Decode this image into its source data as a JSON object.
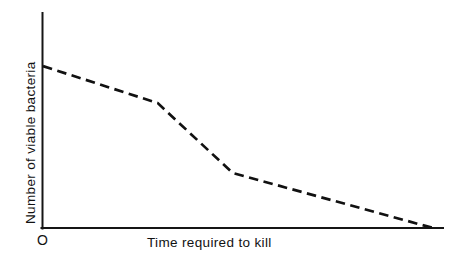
{
  "figure": {
    "background_color": "#ffffff",
    "ink_color": "#111111",
    "origin_label": "O",
    "width": 457,
    "height": 264
  },
  "axes": {
    "x_label": "Time required to kill",
    "y_label": "Number of viable bacteria"
  },
  "chart_data": {
    "type": "line",
    "title": "",
    "subtitle": "",
    "xlabel": "Time required to kill",
    "ylabel": "Number of viable bacteria",
    "grid": false,
    "legend": null,
    "legend_position": "none",
    "axis_ticks": {
      "x": [],
      "y": []
    },
    "axis_tick_labels": {
      "x": [],
      "y": []
    },
    "origin_marker": "O",
    "xlim": [
      0,
      100
    ],
    "ylim": [
      0,
      100
    ],
    "x": [
      0,
      28.7,
      47.4,
      97.5
    ],
    "y": [
      75.3,
      58.1,
      25.6,
      0
    ],
    "series": [
      {
        "name": "Viable bacteria survival curve",
        "style": "dashed",
        "color": "#111111",
        "x": [
          0,
          28.7,
          47.4,
          97.5
        ],
        "y": [
          75.3,
          58.1,
          25.6,
          0
        ],
        "annotations": [
          "shallow initial decline",
          "steep rapid-kill phase",
          "shallow tail to zero"
        ]
      }
    ]
  }
}
